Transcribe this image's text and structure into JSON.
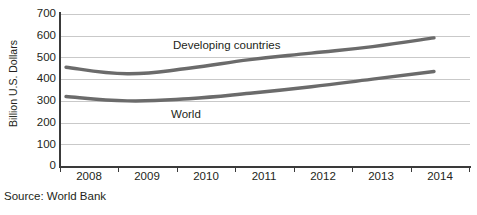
{
  "source_note": "Source: World Bank",
  "chart_data": {
    "type": "line",
    "title": "",
    "xlabel": "",
    "ylabel": "Billion U.S. Dollars",
    "categories": [
      "2008",
      "2009",
      "2010",
      "2011",
      "2012",
      "2013",
      "2014"
    ],
    "ylim": [
      0,
      700
    ],
    "yticks": [
      0,
      100,
      200,
      300,
      400,
      500,
      600,
      700
    ],
    "ytick_labels": [
      "0",
      "100",
      "200",
      "300",
      "400",
      "500",
      "600",
      "700"
    ],
    "grid": true,
    "legend_position": "inline-annotations",
    "series": [
      {
        "name": "Developing countries",
        "color": "#6b6b6b",
        "values": [
          455,
          425,
          450,
          490,
          520,
          550,
          590
        ]
      },
      {
        "name": "World",
        "color": "#6b6b6b",
        "values": [
          320,
          300,
          310,
          335,
          365,
          400,
          435
        ]
      }
    ],
    "annotations": [
      {
        "text": "Developing countries",
        "x": "2010",
        "y": 530
      },
      {
        "text": "World",
        "x": "2009.8",
        "y": 215
      }
    ]
  }
}
